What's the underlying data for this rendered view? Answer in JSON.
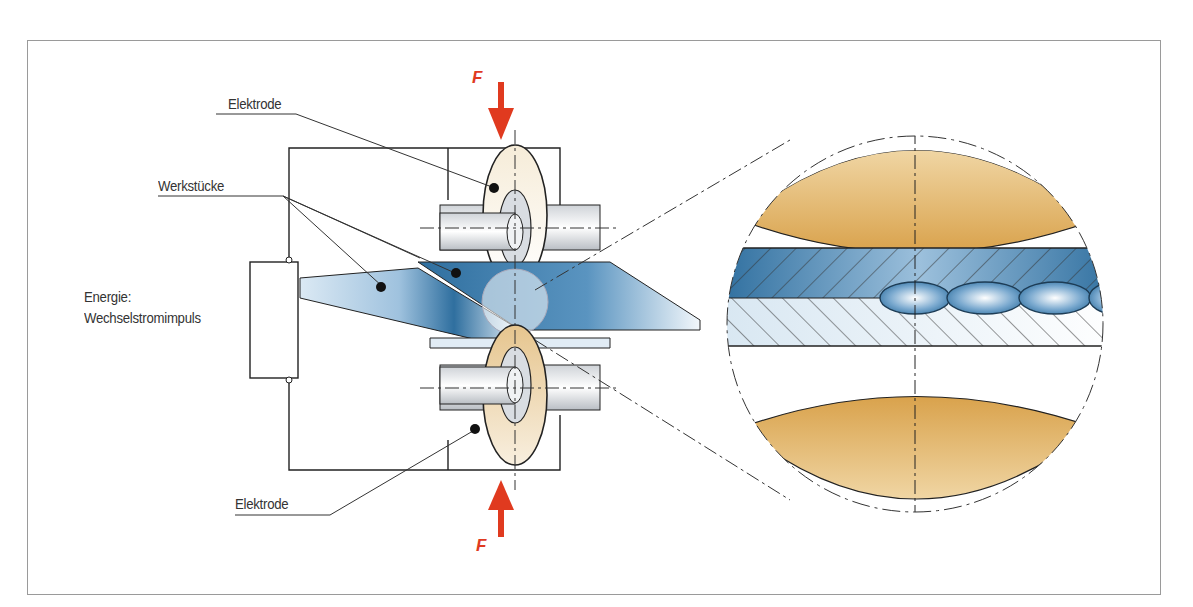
{
  "diagram": {
    "type": "resistance seam welding schematic",
    "labels": {
      "electrode_top": "Elektrode",
      "electrode_bottom": "Elektrode",
      "workpieces": "Werkstücke",
      "energy_line1": "Energie:",
      "energy_line2": "Wechselstromimpuls",
      "force_top": "F",
      "force_bottom": "F"
    },
    "colors": {
      "force_arrow": "#e03a1f",
      "electrode_fill": "#d9a85a",
      "sheet_blue": "#2f6f9f",
      "sheet_light": "#d6e6f2",
      "line": "#222222",
      "frame": "#9a9a9a"
    },
    "detail_view": {
      "description": "Magnified cross-section showing two sheets between roller electrodes with overlapping weld nuggets",
      "nugget_count": 4
    }
  }
}
